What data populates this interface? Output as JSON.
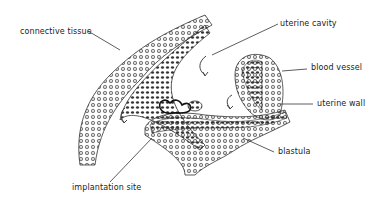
{
  "diagram": {
    "labels": {
      "connective_tissue": "connective tissue",
      "uterine_cavity": "uterine cavity",
      "blood_vessel": "blood vessel",
      "uterine_wall": "uterine wall",
      "blastula": "blastula",
      "implantation_site": "implantation site"
    },
    "colors": {
      "ink": "#222222",
      "background": "#ffffff"
    }
  }
}
